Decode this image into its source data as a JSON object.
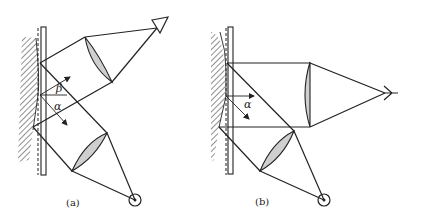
{
  "figure": {
    "panels": [
      {
        "id": "a",
        "caption": "(a)",
        "angle_labels": [
          "β",
          "α"
        ],
        "elements": [
          "hatched-surface",
          "glass-plate",
          "upper-lens",
          "eye",
          "lower-lens",
          "light-source"
        ]
      },
      {
        "id": "b",
        "caption": "(b)",
        "angle_labels": [
          "α"
        ],
        "elements": [
          "hatched-surface",
          "glass-plate",
          "right-lens",
          "eye",
          "lower-lens",
          "light-source"
        ]
      }
    ],
    "colors": {
      "line": "#222222",
      "lens_fill": "#cfcfcf",
      "background": "#ffffff"
    }
  }
}
